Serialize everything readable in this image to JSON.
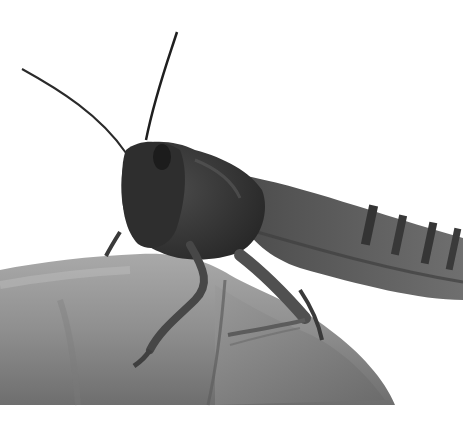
{
  "image": {
    "subject": "grasshopper perched on a human finger",
    "style": "black-and-white photograph",
    "colors": {
      "background": "#ffffff",
      "skin_light": "#b8b8b8",
      "skin_mid": "#8e8e8e",
      "skin_dark": "#5a5a5a",
      "insect_dark": "#2c2c2c",
      "insect_mid": "#4a4a4a",
      "wing": "#6a6a6a",
      "wing_stripe": "#3a3a3a"
    },
    "alt_text": "Grayscale close-up of a large grasshopper with long antennae resting on a fingertip"
  }
}
